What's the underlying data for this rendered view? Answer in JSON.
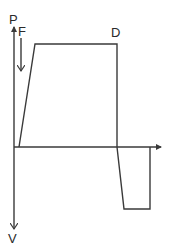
{
  "diagram": {
    "labels": {
      "p_axis": "P",
      "v_axis": "V",
      "point_f": "F",
      "point_d": "D"
    },
    "colors": {
      "line": "#3a3a3a",
      "text": "#2a2a2a",
      "background": "#ffffff"
    },
    "axes": {
      "origin": [
        14,
        147
      ],
      "vertical_top": [
        14,
        26
      ],
      "vertical_bottom": [
        14,
        230
      ],
      "horizontal_end": [
        161,
        147
      ]
    },
    "upper_curve": [
      [
        19,
        147
      ],
      [
        35,
        44
      ],
      [
        117,
        44
      ],
      [
        117,
        147
      ]
    ],
    "lower_curve": [
      [
        117,
        147
      ],
      [
        124,
        209
      ],
      [
        150,
        209
      ],
      [
        150,
        147
      ]
    ],
    "force_arrow": {
      "from": [
        21,
        38
      ],
      "to": [
        21,
        72
      ]
    }
  }
}
